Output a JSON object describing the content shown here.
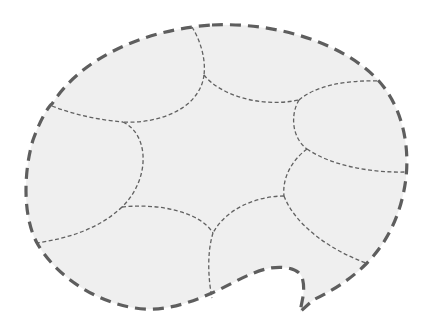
{
  "diagram": {
    "title": "Dashed speech bubble divided into segments",
    "shape": "speech-bubble",
    "segment_count": 8,
    "colors": {
      "fill": "#efefef",
      "outline": "#5e5e5e",
      "segment_lines": "#616161",
      "background": "#ffffff"
    },
    "outline_style": "thick dashed",
    "segment_line_style": "thin dashed"
  }
}
